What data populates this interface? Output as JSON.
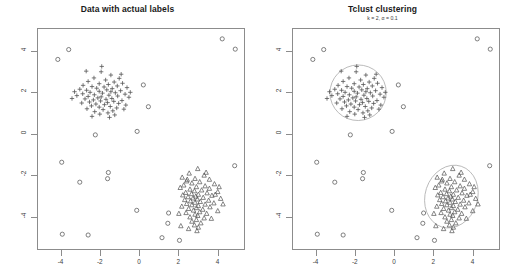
{
  "panels": [
    {
      "id": "actual-labels",
      "title": "Data with actual labels",
      "subtitle": ""
    },
    {
      "id": "tclust-clustering",
      "title": "Tclust clustering",
      "subtitle": "k = 2, α = 0.1"
    }
  ],
  "axes": {
    "x_ticks": [
      "-4",
      "-2",
      "0",
      "2",
      "4"
    ],
    "y_ticks": [
      "4",
      "2",
      "0",
      "-2",
      "-4"
    ],
    "xlim": [
      -5.2,
      5.4
    ],
    "ylim": [
      -5.6,
      5.1
    ],
    "xlabel": "",
    "ylabel": ""
  },
  "style": {
    "frame_color": "#8c8c8c",
    "point_color": "#555555",
    "ellipse_color": "#b0b0b0",
    "title_color": "#1a1a1a",
    "background": "#ffffff"
  },
  "chart_data": {
    "type": "scatter",
    "xlabel": "",
    "ylabel": "",
    "xlim": [
      -5.2,
      5.4
    ],
    "ylim": [
      -5.6,
      5.1
    ],
    "grid": false,
    "legend": "none",
    "annotations": [
      "k = 2, α = 0.1"
    ],
    "series": [
      {
        "name": "cluster-1",
        "marker": "plus",
        "center": [
          -1.85,
          2.0
        ],
        "ellipse": {
          "cx": -1.85,
          "cy": 2.0,
          "rx": 1.45,
          "ry": 1.35,
          "rotation": -12
        },
        "points": [
          [
            -1.95,
            3.02
          ],
          [
            -1.45,
            2.86
          ],
          [
            -2.32,
            2.72
          ],
          [
            -1.02,
            2.7
          ],
          [
            -1.72,
            2.62
          ],
          [
            -2.62,
            2.55
          ],
          [
            -1.28,
            2.52
          ],
          [
            -0.85,
            2.46
          ],
          [
            -2.05,
            2.44
          ],
          [
            -1.58,
            2.4
          ],
          [
            -2.88,
            2.36
          ],
          [
            -1.12,
            2.33
          ],
          [
            -2.42,
            2.3
          ],
          [
            -1.8,
            2.28
          ],
          [
            -0.62,
            2.25
          ],
          [
            -2.18,
            2.22
          ],
          [
            -1.38,
            2.2
          ],
          [
            -3.05,
            2.17
          ],
          [
            -1.66,
            2.14
          ],
          [
            -2.7,
            2.12
          ],
          [
            -0.95,
            2.1
          ],
          [
            -2.05,
            2.07
          ],
          [
            -1.45,
            2.05
          ],
          [
            -2.52,
            2.02
          ],
          [
            -1.22,
            2.0
          ],
          [
            -1.88,
            1.98
          ],
          [
            -2.9,
            1.95
          ],
          [
            -0.72,
            1.93
          ],
          [
            -2.3,
            1.9
          ],
          [
            -1.55,
            1.88
          ],
          [
            -3.2,
            1.86
          ],
          [
            -1.1,
            1.84
          ],
          [
            -2.62,
            1.82
          ],
          [
            -1.95,
            1.8
          ],
          [
            -0.52,
            1.78
          ],
          [
            -2.12,
            1.75
          ],
          [
            -1.4,
            1.72
          ],
          [
            -2.78,
            1.7
          ],
          [
            -1.7,
            1.68
          ],
          [
            -2.35,
            1.65
          ],
          [
            -0.88,
            1.62
          ],
          [
            -1.98,
            1.6
          ],
          [
            -1.3,
            1.58
          ],
          [
            -2.55,
            1.55
          ],
          [
            -1.62,
            1.52
          ],
          [
            -2.95,
            1.5
          ],
          [
            -1.05,
            1.48
          ],
          [
            -2.22,
            1.45
          ],
          [
            -1.78,
            1.42
          ],
          [
            -0.68,
            1.4
          ],
          [
            -2.45,
            1.36
          ],
          [
            -1.48,
            1.33
          ],
          [
            -2.05,
            1.3
          ],
          [
            -1.15,
            1.26
          ],
          [
            -2.68,
            1.22
          ],
          [
            -1.85,
            1.18
          ],
          [
            -1.35,
            1.12
          ],
          [
            -2.28,
            1.08
          ],
          [
            -1.6,
            1.02
          ],
          [
            -2.02,
            0.96
          ],
          [
            -1.25,
            0.92
          ],
          [
            -0.92,
            2.9
          ],
          [
            -3.32,
            2.05
          ],
          [
            -0.45,
            2.02
          ],
          [
            -3.45,
            1.72
          ],
          [
            -1.52,
            0.8
          ],
          [
            -2.42,
            0.85
          ],
          [
            -1.92,
            3.28
          ],
          [
            -2.72,
            3.05
          ],
          [
            -0.78,
            1.2
          ]
        ]
      },
      {
        "name": "cluster-2",
        "marker": "triangle",
        "center": [
          2.95,
          -3.05
        ],
        "ellipse": {
          "cx": 2.95,
          "cy": -3.05,
          "rx": 1.35,
          "ry": 1.55,
          "rotation": 18
        },
        "points": [
          [
            3.02,
            -1.7
          ],
          [
            2.58,
            -1.92
          ],
          [
            3.35,
            -2.02
          ],
          [
            2.22,
            -2.12
          ],
          [
            2.88,
            -2.18
          ],
          [
            3.62,
            -2.22
          ],
          [
            2.45,
            -2.3
          ],
          [
            3.12,
            -2.34
          ],
          [
            2.72,
            -2.4
          ],
          [
            3.88,
            -2.44
          ],
          [
            2.3,
            -2.5
          ],
          [
            3.4,
            -2.54
          ],
          [
            2.95,
            -2.58
          ],
          [
            2.12,
            -2.62
          ],
          [
            3.62,
            -2.66
          ],
          [
            2.62,
            -2.7
          ],
          [
            3.22,
            -2.74
          ],
          [
            2.85,
            -2.78
          ],
          [
            4.05,
            -2.82
          ],
          [
            2.4,
            -2.86
          ],
          [
            3.5,
            -2.88
          ],
          [
            2.7,
            -2.92
          ],
          [
            3.05,
            -2.95
          ],
          [
            2.25,
            -2.98
          ],
          [
            3.75,
            -3.0
          ],
          [
            2.92,
            -3.04
          ],
          [
            2.52,
            -3.07
          ],
          [
            3.3,
            -3.1
          ],
          [
            2.78,
            -3.13
          ],
          [
            4.2,
            -3.15
          ],
          [
            3.0,
            -3.18
          ],
          [
            2.35,
            -3.21
          ],
          [
            3.58,
            -3.24
          ],
          [
            2.65,
            -3.27
          ],
          [
            3.15,
            -3.3
          ],
          [
            2.88,
            -3.34
          ],
          [
            3.85,
            -3.37
          ],
          [
            2.45,
            -3.4
          ],
          [
            3.4,
            -3.43
          ],
          [
            2.72,
            -3.46
          ],
          [
            3.05,
            -3.5
          ],
          [
            2.2,
            -3.53
          ],
          [
            3.65,
            -3.56
          ],
          [
            2.95,
            -3.6
          ],
          [
            2.55,
            -3.64
          ],
          [
            3.28,
            -3.68
          ],
          [
            2.8,
            -3.72
          ],
          [
            4.05,
            -3.75
          ],
          [
            3.12,
            -3.8
          ],
          [
            2.42,
            -3.84
          ],
          [
            3.48,
            -3.88
          ],
          [
            2.88,
            -3.92
          ],
          [
            3.02,
            -3.98
          ],
          [
            2.62,
            -4.05
          ],
          [
            3.35,
            -4.1
          ],
          [
            2.95,
            -4.18
          ],
          [
            2.72,
            -4.26
          ],
          [
            3.18,
            -4.34
          ],
          [
            2.85,
            -4.44
          ],
          [
            3.05,
            -4.55
          ],
          [
            2.55,
            -4.62
          ],
          [
            3.92,
            -2.95
          ],
          [
            4.32,
            -3.42
          ],
          [
            2.05,
            -3.88
          ],
          [
            2.15,
            -4.48
          ],
          [
            3.72,
            -4.12
          ],
          [
            4.12,
            -2.58
          ],
          [
            2.48,
            -2.22
          ],
          [
            3.45,
            -1.88
          ],
          [
            2.98,
            -4.72
          ]
        ]
      },
      {
        "name": "outliers",
        "marker": "circle",
        "points": [
          [
            -3.62,
            4.1
          ],
          [
            -4.18,
            3.62
          ],
          [
            4.28,
            4.62
          ],
          [
            4.95,
            4.12
          ],
          [
            0.22,
            2.38
          ],
          [
            0.48,
            1.32
          ],
          [
            -0.1,
            0.12
          ],
          [
            -3.98,
            -1.38
          ],
          [
            4.92,
            -1.55
          ],
          [
            -1.58,
            -1.88
          ],
          [
            -3.05,
            -2.35
          ],
          [
            -1.62,
            -2.18
          ],
          [
            -0.12,
            -3.72
          ],
          [
            1.52,
            -3.85
          ],
          [
            1.48,
            -4.35
          ],
          [
            -3.95,
            -4.88
          ],
          [
            -2.62,
            -4.92
          ],
          [
            -2.25,
            -0.05
          ],
          [
            1.18,
            -5.05
          ],
          [
            2.08,
            -5.18
          ]
        ]
      }
    ]
  }
}
